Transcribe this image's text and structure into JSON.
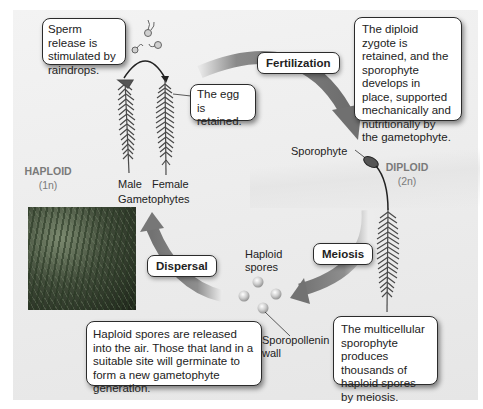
{
  "diagram": {
    "phases": {
      "haploid": {
        "label": "HAPLOID",
        "ploidy": "(1n)"
      },
      "diploid": {
        "label": "DIPLOID",
        "ploidy": "(2n)"
      }
    },
    "process_labels": {
      "fertilization": "Fertilization",
      "meiosis": "Meiosis",
      "dispersal": "Dispersal"
    },
    "callouts": {
      "sperm_release": "Sperm release is stimulated by raindrops.",
      "egg_retained": "The egg is retained.",
      "zygote": "The diploid zygote is retained, and the sporophyte develops in place, supported mechanically and nutritionally by the gametophyte.",
      "sporophyte_produces": "The multicellular sporophyte produces thousands of haploid spores by meiosis.",
      "spores_released": "Haploid spores are released into the air. Those that land in a suitable site will germinate to form a new gametophyte generation."
    },
    "labels": {
      "male": "Male",
      "female": "Female",
      "gametophytes": "Gametophytes",
      "sporophyte": "Sporophyte",
      "haploid_spores_1": "Haploid",
      "haploid_spores_2": "spores",
      "sporopollenin_1": "Sporopollenin",
      "sporopollenin_2": "wall"
    },
    "colors": {
      "arrow": "#7f7f7f",
      "panel": "#eeeeee",
      "phase_text": "#7a7a7a",
      "plant": "#4a4a4a"
    }
  }
}
